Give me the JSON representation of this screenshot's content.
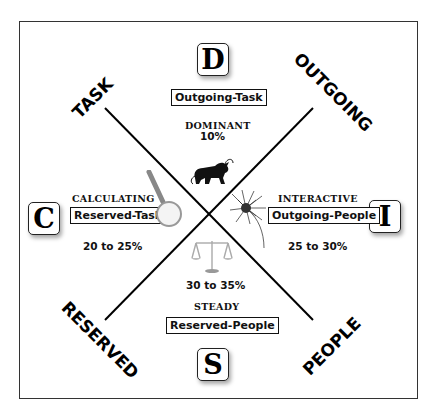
{
  "axes": {
    "task": "TASK",
    "outgoing": "OUTGOING",
    "reserved": "RESERVED",
    "people": "PEOPLE"
  },
  "quadrants": {
    "d": {
      "letter": "D",
      "tag": "Outgoing-Task",
      "trait": "DOMINANT",
      "percent": "10%",
      "icon": "bull-icon"
    },
    "i": {
      "letter": "I",
      "tag": "Outgoing-People",
      "trait": "INTERACTIVE",
      "percent": "25 to 30%",
      "icon": "firework-icon"
    },
    "s": {
      "letter": "S",
      "tag": "Reserved-People",
      "trait": "STEADY",
      "percent": "30 to 35%",
      "icon": "scales-icon"
    },
    "c": {
      "letter": "C",
      "tag": "Reserved-Task",
      "trait": "CALCULATING",
      "percent": "20 to 25%",
      "icon": "magnifying-glass-icon"
    }
  },
  "colors": {
    "line": "#000000",
    "frame": "#333333",
    "background": "#ffffff"
  }
}
